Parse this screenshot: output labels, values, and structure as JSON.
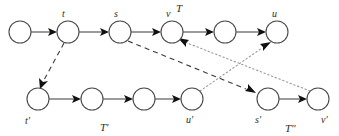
{
  "figure": {
    "kind": "directed-graph-diagram",
    "background_color": "#ffffff",
    "node_stroke_color": "#4a4a4a",
    "node_fill_color": "#ffffff",
    "solid_edge_color": "#4a4a4a",
    "dashed_edge_color": "#3a3a3a",
    "dotted_edge_color": "#9a9a9a",
    "label_color": "#2b2b2b"
  },
  "path_labels": {
    "top": "T",
    "bottom_left": "T'",
    "bottom_right": "T\""
  },
  "node_labels": {
    "t": "t",
    "s": "s",
    "v": "v",
    "u": "u",
    "t_prime": "t'",
    "u_prime": "u'",
    "s_prime": "s'",
    "v_prime": "v'"
  },
  "nodes": [
    {
      "id": "n0",
      "label": "",
      "cx": 20,
      "cy": 32,
      "r": 11,
      "row": "top"
    },
    {
      "id": "t",
      "label": "t",
      "cx": 68,
      "cy": 32,
      "r": 11,
      "row": "top"
    },
    {
      "id": "s",
      "label": "s",
      "cx": 120,
      "cy": 32,
      "r": 11,
      "row": "top"
    },
    {
      "id": "v",
      "label": "v",
      "cx": 172,
      "cy": 32,
      "r": 11,
      "row": "top"
    },
    {
      "id": "n4",
      "label": "",
      "cx": 225,
      "cy": 32,
      "r": 11,
      "row": "top"
    },
    {
      "id": "u",
      "label": "u",
      "cx": 277,
      "cy": 32,
      "r": 11,
      "row": "top"
    },
    {
      "id": "tprime",
      "label": "t'",
      "cx": 38,
      "cy": 99,
      "r": 11,
      "row": "bottom-left"
    },
    {
      "id": "b1",
      "label": "",
      "cx": 92,
      "cy": 99,
      "r": 11,
      "row": "bottom-left"
    },
    {
      "id": "b2",
      "label": "",
      "cx": 144,
      "cy": 99,
      "r": 11,
      "row": "bottom-left"
    },
    {
      "id": "uprime",
      "label": "u'",
      "cx": 192,
      "cy": 99,
      "r": 11,
      "row": "bottom-left"
    },
    {
      "id": "sprime",
      "label": "s'",
      "cx": 268,
      "cy": 99,
      "r": 11,
      "row": "bottom-right"
    },
    {
      "id": "vprime",
      "label": "v'",
      "cx": 318,
      "cy": 99,
      "r": 11,
      "row": "bottom-right"
    }
  ],
  "edges": [
    {
      "from": "n0",
      "to": "t",
      "style": "solid",
      "arrow": true
    },
    {
      "from": "t",
      "to": "s",
      "style": "solid",
      "arrow": true
    },
    {
      "from": "s",
      "to": "v",
      "style": "solid",
      "arrow": true
    },
    {
      "from": "v",
      "to": "n4",
      "style": "solid",
      "arrow": true
    },
    {
      "from": "n4",
      "to": "u",
      "style": "solid",
      "arrow": true
    },
    {
      "from": "tprime",
      "to": "b1",
      "style": "solid",
      "arrow": true
    },
    {
      "from": "b1",
      "to": "b2",
      "style": "solid",
      "arrow": true
    },
    {
      "from": "b2",
      "to": "uprime",
      "style": "solid",
      "arrow": true
    },
    {
      "from": "sprime",
      "to": "vprime",
      "style": "solid",
      "arrow": true
    },
    {
      "from": "t",
      "to": "tprime",
      "style": "dashed",
      "arrow": true
    },
    {
      "from": "s",
      "to": "sprime",
      "style": "dashed",
      "arrow": true
    },
    {
      "from": "uprime",
      "to": "u",
      "style": "dotted",
      "arrow": true
    },
    {
      "from": "v",
      "to": "vprime",
      "style": "dotted",
      "arrow": true,
      "arrow_at_source": true
    }
  ],
  "label_positions": {
    "t": {
      "x": 62,
      "y": 17
    },
    "s": {
      "x": 114,
      "y": 17
    },
    "v": {
      "x": 166,
      "y": 17
    },
    "u": {
      "x": 272,
      "y": 17
    },
    "T": {
      "x": 176,
      "y": 12
    },
    "t_prime": {
      "x": 25,
      "y": 123
    },
    "u_prime": {
      "x": 188,
      "y": 122
    },
    "s_prime": {
      "x": 256,
      "y": 122
    },
    "v_prime": {
      "x": 322,
      "y": 122
    },
    "T_prime": {
      "x": 103,
      "y": 130
    },
    "T_dprime": {
      "x": 290,
      "y": 131
    }
  }
}
